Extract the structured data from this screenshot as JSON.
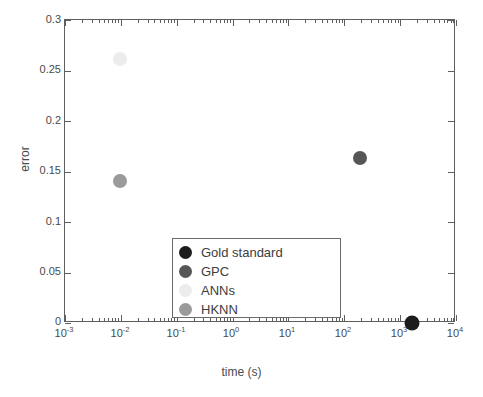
{
  "chart_data": {
    "type": "scatter",
    "title": "",
    "xlabel": "time (s)",
    "ylabel": "error",
    "xscale": "log",
    "yscale": "linear",
    "xlim": [
      0.001,
      10000
    ],
    "ylim": [
      0,
      0.3
    ],
    "grid": false,
    "legend_position": "inside bottom-center",
    "x_tick_labels": [
      "10-3",
      "10-2",
      "10-1",
      "100",
      "101",
      "102",
      "103",
      "104"
    ],
    "x_tick_values": [
      0.001,
      0.01,
      0.1,
      1,
      10,
      100,
      1000,
      10000
    ],
    "y_tick_labels": [
      "0",
      "0.05",
      "0.1",
      "0.15",
      "0.2",
      "0.25",
      "0.3"
    ],
    "y_tick_values": [
      0,
      0.05,
      0.1,
      0.15,
      0.2,
      0.25,
      0.3
    ],
    "series": [
      {
        "name": "Gold standard",
        "color": "#1c1c1c",
        "x": 1600,
        "y": 0.0,
        "marker_size": 15
      },
      {
        "name": "GPC",
        "color": "#565656",
        "x": 190,
        "y": 0.163,
        "marker_size": 14
      },
      {
        "name": "ANNs",
        "color": "#ececec",
        "x": 0.0095,
        "y": 0.261,
        "marker_size": 14
      },
      {
        "name": "HKNN",
        "color": "#9a9a9a",
        "x": 0.0095,
        "y": 0.141,
        "marker_size": 14
      }
    ]
  },
  "axes": {
    "x_title": "time (s)",
    "y_title": "error",
    "x_ticks": [
      {
        "mantissa": "10",
        "exponent": "-3"
      },
      {
        "mantissa": "10",
        "exponent": "-2"
      },
      {
        "mantissa": "10",
        "exponent": "-1"
      },
      {
        "mantissa": "10",
        "exponent": "0"
      },
      {
        "mantissa": "10",
        "exponent": "1"
      },
      {
        "mantissa": "10",
        "exponent": "2"
      },
      {
        "mantissa": "10",
        "exponent": "3"
      },
      {
        "mantissa": "10",
        "exponent": "4"
      }
    ],
    "y_ticks": [
      "0.3",
      "0.25",
      "0.2",
      "0.15",
      "0.1",
      "0.05",
      "0"
    ]
  },
  "legend": {
    "items": [
      {
        "label": "Gold standard",
        "color": "#1c1c1c"
      },
      {
        "label": "GPC",
        "color": "#565656"
      },
      {
        "label": "ANNs",
        "color": "#ececec"
      },
      {
        "label": "HKNN",
        "color": "#9a9a9a"
      }
    ]
  },
  "colors": {
    "axis": "#5e5e5e",
    "text": "#4a4a4a",
    "background": "#ffffff",
    "legend_border": "#6b6b6b"
  }
}
